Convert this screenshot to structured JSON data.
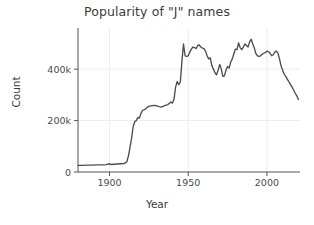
{
  "chart_data": {
    "type": "line",
    "title": "Popularity of \"J\" names",
    "xlabel": "Year",
    "ylabel": "Count",
    "xlim": [
      1880,
      2021
    ],
    "ylim": [
      0,
      560000
    ],
    "grid": true,
    "legend": null,
    "line_color": "#4d4d4d",
    "xticks": [
      1900,
      1950,
      2000
    ],
    "xtick_labels": [
      "1900",
      "1950",
      "2000"
    ],
    "yticks": [
      0,
      200000,
      400000
    ],
    "ytick_labels": [
      "0",
      "200k",
      "400k"
    ],
    "series": [
      {
        "name": "J names",
        "x": [
          1880,
          1883,
          1886,
          1889,
          1892,
          1895,
          1898,
          1900,
          1901,
          1903,
          1905,
          1907,
          1909,
          1910,
          1911,
          1912,
          1913,
          1914,
          1915,
          1916,
          1917,
          1918,
          1919,
          1920,
          1921,
          1922,
          1923,
          1924,
          1925,
          1927,
          1929,
          1931,
          1933,
          1935,
          1937,
          1939,
          1940,
          1941,
          1942,
          1943,
          1944,
          1945,
          1946,
          1947,
          1948,
          1949,
          1950,
          1951,
          1952,
          1953,
          1954,
          1955,
          1956,
          1957,
          1958,
          1959,
          1960,
          1961,
          1962,
          1963,
          1964,
          1965,
          1966,
          1967,
          1968,
          1969,
          1970,
          1971,
          1972,
          1973,
          1974,
          1975,
          1976,
          1977,
          1978,
          1979,
          1980,
          1981,
          1982,
          1983,
          1984,
          1985,
          1986,
          1987,
          1988,
          1989,
          1990,
          1991,
          1992,
          1993,
          1994,
          1995,
          1996,
          1997,
          1998,
          1999,
          2000,
          2001,
          2002,
          2003,
          2004,
          2005,
          2006,
          2007,
          2008,
          2009,
          2010,
          2011,
          2012,
          2013,
          2014,
          2015,
          2016,
          2017,
          2018,
          2019,
          2020
        ],
        "y": [
          26000,
          26000,
          26500,
          27000,
          28000,
          28000,
          28500,
          32000,
          29000,
          30000,
          31000,
          32000,
          33000,
          35000,
          40000,
          62000,
          95000,
          130000,
          175000,
          196000,
          200000,
          212000,
          210000,
          228000,
          240000,
          242000,
          246000,
          252000,
          255000,
          258000,
          259000,
          255000,
          252000,
          258000,
          262000,
          272000,
          268000,
          284000,
          330000,
          352000,
          340000,
          350000,
          430000,
          498000,
          452000,
          450000,
          452000,
          466000,
          478000,
          486000,
          484000,
          480000,
          492000,
          494000,
          486000,
          482000,
          480000,
          470000,
          452000,
          440000,
          444000,
          414000,
          400000,
          386000,
          378000,
          396000,
          418000,
          400000,
          372000,
          374000,
          396000,
          410000,
          404000,
          428000,
          440000,
          460000,
          478000,
          476000,
          502000,
          484000,
          476000,
          486000,
          498000,
          492000,
          486000,
          506000,
          516000,
          498000,
          482000,
          460000,
          452000,
          450000,
          452000,
          458000,
          462000,
          464000,
          470000,
          468000,
          462000,
          452000,
          456000,
          466000,
          470000,
          462000,
          440000,
          412000,
          396000,
          380000,
          372000,
          360000,
          350000,
          340000,
          330000,
          318000,
          306000,
          296000,
          282000
        ]
      }
    ]
  }
}
